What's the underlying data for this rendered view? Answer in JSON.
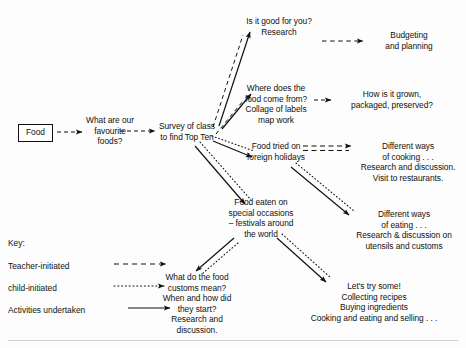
{
  "diagram": {
    "type": "flowchart-mind-map",
    "nodes": {
      "food": {
        "label": "Food",
        "shape": "box"
      },
      "question": {
        "lines": [
          "What are our",
          "favourite",
          "foods?"
        ]
      },
      "survey": {
        "lines": [
          "Survey of class",
          "to find Top Ten"
        ]
      },
      "good_for_you": {
        "lines": [
          "Is it good for you?",
          "Research"
        ]
      },
      "budgeting": {
        "lines": [
          "Budgeting",
          "and planning"
        ]
      },
      "where_from": {
        "lines": [
          "Where does the",
          "food come from?",
          "Collage of labels",
          "map work"
        ]
      },
      "how_grown": {
        "lines": [
          "How is it grown,",
          "packaged, preserved?"
        ]
      },
      "foreign_holidays": {
        "lines": [
          "Food tried on",
          "foreign holidays"
        ]
      },
      "ways_cooking": {
        "lines": [
          "Different ways",
          "of cooking . . .",
          "Research and discussion.",
          "Visit to restaurants."
        ]
      },
      "special_occasions": {
        "lines": [
          "Food eaten on",
          "special occasions",
          "– festivals around",
          "the world"
        ]
      },
      "ways_eating": {
        "lines": [
          "Different ways",
          "of eating . . .",
          "Research & discussion on",
          "utensils and customs"
        ]
      },
      "customs": {
        "lines": [
          "What do the food",
          "customs mean?",
          "When and how did",
          "they start?",
          "Research and",
          "discussion."
        ]
      },
      "try_some": {
        "lines": [
          "Let's try some!",
          "Collecting recipes",
          "Buying ingredients",
          "Cooking and eating and selling . . ."
        ]
      }
    },
    "key": {
      "title": "Key:",
      "items": [
        {
          "label": "Teacher-initiated",
          "style": "dashed"
        },
        {
          "label": "child-initiated",
          "style": "dotted"
        },
        {
          "label": "Activities undertaken",
          "style": "solid"
        }
      ]
    },
    "colors": {
      "ink": "#111111",
      "background": "#fdfdfd",
      "rule": "#cfcfcf"
    }
  }
}
